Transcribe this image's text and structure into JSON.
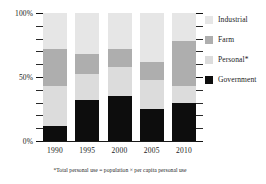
{
  "chart_data": {
    "type": "bar",
    "title": "",
    "subtitle": "",
    "xlabel": "",
    "ylabel": "",
    "stacked": true,
    "normalized_percent": true,
    "grid": false,
    "legend_position": "right",
    "ylim": [
      0,
      100
    ],
    "y_tick_labels": [
      "100%",
      "50%",
      "0%"
    ],
    "y_tick_values": [
      100,
      50,
      0
    ],
    "y_minor_tick_values": [
      90,
      80,
      70,
      60,
      40,
      30,
      20,
      10
    ],
    "categories": [
      "1990",
      "1995",
      "2000",
      "2005",
      "2010"
    ],
    "series": [
      {
        "name": "Government",
        "color": "#0d0d0d",
        "values": [
          12,
          32,
          35,
          25,
          30
        ]
      },
      {
        "name": "Personal*",
        "color": "#dcdcdc",
        "values": [
          31,
          20,
          23,
          23,
          13
        ]
      },
      {
        "name": "Farm",
        "color": "#aeaeae",
        "values": [
          29,
          16,
          14,
          14,
          35
        ]
      },
      {
        "name": "Industrial",
        "color": "#e6e6e6",
        "values": [
          28,
          32,
          28,
          38,
          22
        ]
      }
    ],
    "stack_order_bottom_to_top": [
      "Government",
      "Personal*",
      "Farm",
      "Industrial"
    ],
    "annotations": [
      "*Total personal use = population × per capita personal use"
    ]
  },
  "legend": {
    "items": [
      {
        "label": "Industrial",
        "color": "#e6e6e6"
      },
      {
        "label": "Farm",
        "color": "#aeaeae"
      },
      {
        "label": "Personal*",
        "color": "#dcdcdc"
      },
      {
        "label": "Government",
        "color": "#0d0d0d"
      }
    ]
  },
  "axes": {
    "y_labels": [
      "100%",
      "50%",
      "0%"
    ],
    "x_labels": [
      "1990",
      "1995",
      "2000",
      "2005",
      "2010"
    ]
  },
  "footnote": {
    "text": "*Total personal use = population × per capita personal use"
  }
}
